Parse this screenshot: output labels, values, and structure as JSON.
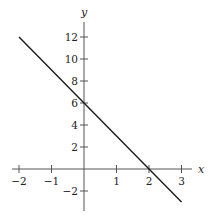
{
  "chart_data": {
    "type": "line",
    "title": "",
    "xlabel": "x",
    "ylabel": "y",
    "xlim": [
      -2.2,
      3.3
    ],
    "ylim": [
      -3.8,
      13.2
    ],
    "grid": false,
    "legend": null,
    "x_ticks": [
      -2,
      -1,
      1,
      2,
      3
    ],
    "x_tick_labels": [
      "−2",
      "−1",
      "1",
      "2",
      "3"
    ],
    "y_ticks": [
      -2,
      2,
      4,
      6,
      8,
      10,
      12
    ],
    "y_tick_labels": [
      "−2",
      "2",
      "4",
      "6",
      "8",
      "10",
      "12"
    ],
    "series": [
      {
        "name": "y = -3x + 6",
        "x": [
          -2,
          3
        ],
        "y": [
          12,
          -3
        ],
        "color": "#1a1a1a"
      }
    ]
  },
  "layout": {
    "origin_px": [
      84,
      169
    ],
    "x_unit_px": 32.5,
    "y_unit_px": 11,
    "x_axis_px": [
      12,
      192
    ],
    "y_axis_px": [
      22,
      211
    ]
  }
}
